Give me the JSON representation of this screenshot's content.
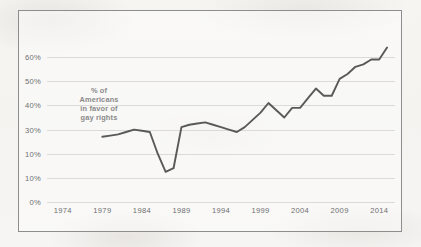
{
  "chart_data": {
    "type": "line",
    "title": "",
    "subtitle": "",
    "xlabel": "",
    "ylabel": "",
    "annotation_lines": [
      "% of",
      "Americans",
      "in favor of",
      "gay rights"
    ],
    "annotation_text": "% of Americans in favor of gay rights",
    "xlim": [
      1972,
      2016
    ],
    "ylim": [
      0,
      70
    ],
    "grid": true,
    "legend": "none",
    "line_color": "#595959",
    "grid_color": "#dcdad6",
    "axis_label_color": "#6f6f6f",
    "annotation_color": "#8a8a8a",
    "frame_color": "#8d8d8d",
    "background_color": "#f7f6f4",
    "y_tick_values": [
      60,
      50,
      40,
      30,
      20,
      10,
      0
    ],
    "y_tick_labels": [
      "60%",
      "50%",
      "40%",
      "30%",
      "10%",
      "10%",
      "0%"
    ],
    "y_tick_note": "fifth label from top is rendered as 10% in the source image where 20% would fall",
    "x_tick_labels": [
      "1974",
      "1979",
      "1984",
      "1989",
      "1994",
      "1999",
      "2004",
      "2009",
      "2014"
    ],
    "x_tick_values": [
      1974,
      1979,
      1984,
      1989,
      1994,
      1999,
      2004,
      2009,
      2014
    ],
    "series": [
      {
        "name": "% of Americans in favor of gay rights",
        "x": [
          1979,
          1980,
          1981,
          1982,
          1983,
          1984,
          1985,
          1986,
          1987,
          1988,
          1989,
          1990,
          1991,
          1992,
          1993,
          1994,
          1995,
          1996,
          1997,
          1998,
          1999,
          2000,
          2001,
          2002,
          2003,
          2004,
          2005,
          2006,
          2007,
          2008,
          2009,
          2010,
          2011,
          2012,
          2013,
          2014,
          2015
        ],
        "values": [
          27,
          27.5,
          28,
          29,
          30,
          29.5,
          29,
          20,
          12.5,
          14,
          31,
          32,
          32.5,
          33,
          32,
          31,
          30,
          29,
          31,
          34,
          37,
          41,
          38,
          35,
          39,
          39,
          43,
          47,
          44,
          44,
          51,
          53,
          56,
          57,
          59,
          59,
          64
        ]
      }
    ]
  }
}
